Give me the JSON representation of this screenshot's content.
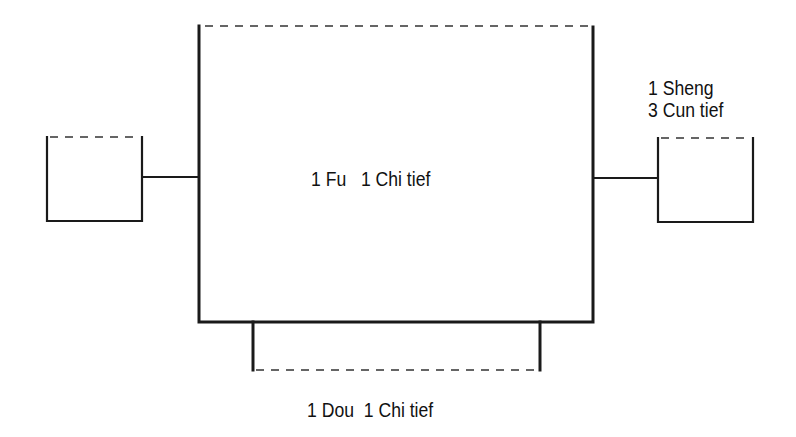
{
  "diagram": {
    "type": "vessel-schematic",
    "colors": {
      "line": "#1a1a1a",
      "background": "#ffffff"
    },
    "components": [
      {
        "id": "fu",
        "name": "main-vessel",
        "label": "1 Fu   1 Chi tief",
        "open_top": true
      },
      {
        "id": "dou",
        "name": "bottom-base",
        "label": "1 Dou  1 Chi tief",
        "open_bottom": true
      },
      {
        "id": "left-ear",
        "name": "left-handle",
        "label": "",
        "open_top": true
      },
      {
        "id": "sheng",
        "name": "right-handle",
        "label_line1": "1 Sheng",
        "label_line2": "3 Cun tief",
        "open_top": true
      }
    ],
    "connections": [
      {
        "from": "left-ear",
        "to": "fu"
      },
      {
        "from": "fu",
        "to": "sheng"
      },
      {
        "from": "fu",
        "to": "dou"
      }
    ]
  }
}
